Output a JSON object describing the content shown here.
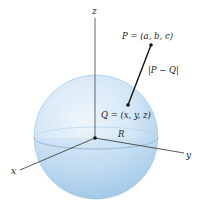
{
  "figure": {
    "type": "diagram",
    "axes": {
      "x_label": "x",
      "y_label": "y",
      "z_label": "z"
    },
    "points": {
      "P": {
        "label": "P = (a, b, c)"
      },
      "Q": {
        "label": "Q = (x, y, z)"
      }
    },
    "segment_label": "|P − Q|",
    "radius_label": "R",
    "colors": {
      "sphere_fill": "#cfe3f3",
      "sphere_shade": "#9cc4e4",
      "sphere_edge": "#a9c9e6",
      "axis": "#444444",
      "segment": "#111111",
      "text": "#222222"
    }
  }
}
